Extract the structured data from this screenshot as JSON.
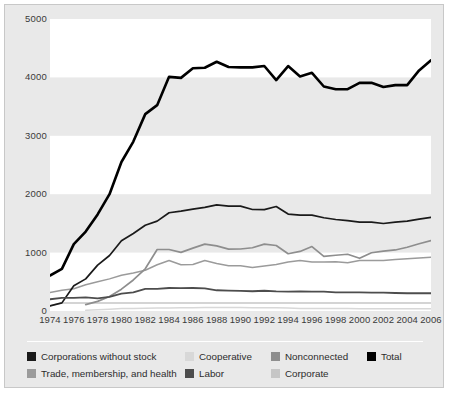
{
  "chart_data": {
    "type": "line",
    "title": "",
    "subtitle": "",
    "xlabel": "",
    "ylabel": "",
    "xlim": [
      1974,
      2006
    ],
    "ylim": [
      0,
      5000
    ],
    "yticks": [
      0,
      1000,
      2000,
      3000,
      4000,
      5000
    ],
    "ytick_labels": [
      "0",
      "1000",
      "2000",
      "3000",
      "4000",
      "5000"
    ],
    "xticks": [
      1974,
      1976,
      1978,
      1980,
      1982,
      1984,
      1986,
      1988,
      1990,
      1992,
      1994,
      1996,
      1998,
      2000,
      2002,
      2004,
      2006
    ],
    "xtick_labels": [
      "1974",
      "1976",
      "1978",
      "1980",
      "1982",
      "1984",
      "1986",
      "1988",
      "1990",
      "1992",
      "1994",
      "1996",
      "1998",
      "2000",
      "2002",
      "2004",
      "2006"
    ],
    "grid": "horizontal-bands",
    "legend_position": "bottom",
    "x": [
      1974,
      1975,
      1976,
      1977,
      1978,
      1979,
      1980,
      1981,
      1982,
      1983,
      1984,
      1985,
      1986,
      1987,
      1988,
      1989,
      1990,
      1991,
      1992,
      1993,
      1994,
      1995,
      1996,
      1997,
      1998,
      1999,
      2000,
      2001,
      2002,
      2003,
      2004,
      2005,
      2006
    ],
    "series": [
      {
        "name": "Total",
        "color": "#000000",
        "width": 2.6,
        "values": [
          608,
          722,
          1146,
          1360,
          1653,
          2000,
          2551,
          2901,
          3371,
          3525,
          4009,
          3992,
          4157,
          4165,
          4268,
          4178,
          4172,
          4172,
          4195,
          3954,
          4194,
          4016,
          4079,
          3844,
          3798,
          3798,
          3907,
          3907,
          3835,
          3868,
          3868,
          4120,
          4292
        ]
      },
      {
        "name": "Nonconnected",
        "color": "#8e8e8e",
        "width": 1.7,
        "values": [
          0,
          0,
          0,
          110,
          165,
          247,
          374,
          531,
          723,
          1053,
          1053,
          1003,
          1077,
          1145,
          1115,
          1060,
          1062,
          1083,
          1145,
          1121,
          980,
          1020,
          1103,
          935,
          955,
          972,
          902,
          998,
          1024,
          1045,
          1092,
          1151,
          1206
        ]
      },
      {
        "name": "Corporations without stock",
        "color": "#1a1a1a",
        "width": 1.7,
        "values": [
          89,
          139,
          433,
          550,
          785,
          950,
          1204,
          1327,
          1469,
          1538,
          1682,
          1710,
          1744,
          1775,
          1817,
          1796,
          1795,
          1738,
          1735,
          1789,
          1660,
          1642,
          1642,
          1597,
          1567,
          1548,
          1523,
          1523,
          1498,
          1523,
          1538,
          1572,
          1604
        ]
      },
      {
        "name": "Trade, membership, and health",
        "color": "#9b9b9b",
        "width": 1.5,
        "values": [
          318,
          357,
          380,
          450,
          500,
          550,
          612,
          649,
          698,
          792,
          865,
          792,
          796,
          865,
          812,
          774,
          774,
          745,
          770,
          795,
          838,
          865,
          838,
          838,
          845,
          826,
          864,
          864,
          864,
          880,
          896,
          908,
          919
        ]
      },
      {
        "name": "Labor",
        "color": "#4d4d4d",
        "width": 1.8,
        "values": [
          201,
          226,
          224,
          234,
          217,
          240,
          297,
          318,
          380,
          378,
          394,
          392,
          394,
          388,
          355,
          350,
          346,
          338,
          347,
          337,
          333,
          334,
          332,
          332,
          318,
          318,
          318,
          316,
          313,
          308,
          304,
          304,
          304
        ]
      },
      {
        "name": "Corporate",
        "color": "#c6c6c6",
        "width": 1.5,
        "values": [
          89,
          139,
          139,
          139,
          139,
          139,
          139,
          139,
          139,
          139,
          139,
          139,
          139,
          139,
          139,
          139,
          139,
          139,
          139,
          139,
          139,
          139,
          139,
          139,
          139,
          139,
          139,
          139,
          139,
          139,
          139,
          139,
          139
        ]
      },
      {
        "name": "Cooperative",
        "color": "#d8d8d8",
        "width": 1.5,
        "values": [
          0,
          0,
          0,
          12,
          20,
          29,
          42,
          41,
          47,
          52,
          52,
          56,
          56,
          59,
          59,
          59,
          59,
          56,
          56,
          56,
          53,
          44,
          41,
          41,
          41,
          41,
          39,
          39,
          39,
          39,
          39,
          39,
          39
        ]
      }
    ]
  },
  "legend": {
    "rows": [
      [
        {
          "label": "Corporations without stock",
          "color": "#1a1a1a"
        },
        {
          "label": "Cooperative",
          "color": "#d8d8d8"
        },
        {
          "label": "Nonconnected",
          "color": "#8e8e8e"
        },
        {
          "label": "Total",
          "color": "#000000"
        }
      ],
      [
        {
          "label": "Trade, membership, and health",
          "color": "#9b9b9b"
        },
        {
          "label": "Labor",
          "color": "#4d4d4d"
        },
        {
          "label": "Corporate",
          "color": "#c6c6c6"
        }
      ]
    ]
  },
  "style": {
    "figure_background": "#e9e9e9",
    "plot_background": "#e9e9e9",
    "band_color": "#ffffff",
    "border_color": "#c8c8c8",
    "tick_label_color": "#3a3a3a"
  }
}
